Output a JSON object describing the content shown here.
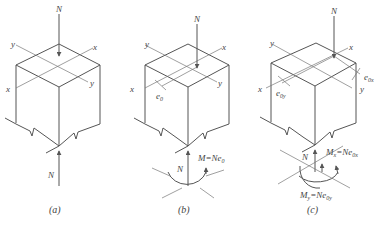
{
  "figure": {
    "panels": [
      {
        "id": "a",
        "caption": "(a)",
        "load_top": "N",
        "load_bottom": "N",
        "axis_x": "x",
        "axis_y": "y"
      },
      {
        "id": "b",
        "caption": "(b)",
        "load_top": "N",
        "load_bottom": "N",
        "axis_x": "x",
        "axis_y": "y",
        "eccentricity": "e",
        "eccentricity_sub": "0",
        "moment_label": "M=Ne",
        "moment_sub": "0"
      },
      {
        "id": "c",
        "caption": "(c)",
        "load_top": "N",
        "load_bottom": "N",
        "axis_x": "x",
        "axis_y": "y",
        "ecc_x": "e",
        "ecc_x_sub": "0x",
        "ecc_y": "e",
        "ecc_y_sub": "0y",
        "moment_x": "M",
        "moment_x_sub": "x",
        "moment_x_eq": "=Ne",
        "moment_x_eq_sub": "0x",
        "moment_y": "M",
        "moment_y_sub": "y",
        "moment_y_eq": "=Ne",
        "moment_y_eq_sub": "0y"
      }
    ],
    "colors": {
      "line": "#555555",
      "text": "#444444",
      "background": "#ffffff"
    }
  }
}
